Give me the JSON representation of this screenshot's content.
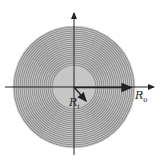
{
  "diagram": {
    "labels": {
      "inner_radius": "R",
      "inner_radius_sub": "i",
      "outer_radius": "R",
      "outer_radius_sub": "o"
    },
    "colors": {
      "ring_fill": "#8a8a8a",
      "ring_line": "#555555",
      "inner_fill": "#c4c4c4",
      "axis": "#222222"
    },
    "geometry": {
      "center": [
        74,
        87
      ],
      "outer_radius_px": 61,
      "inner_radius_px": 21,
      "ring_count": 20
    }
  }
}
